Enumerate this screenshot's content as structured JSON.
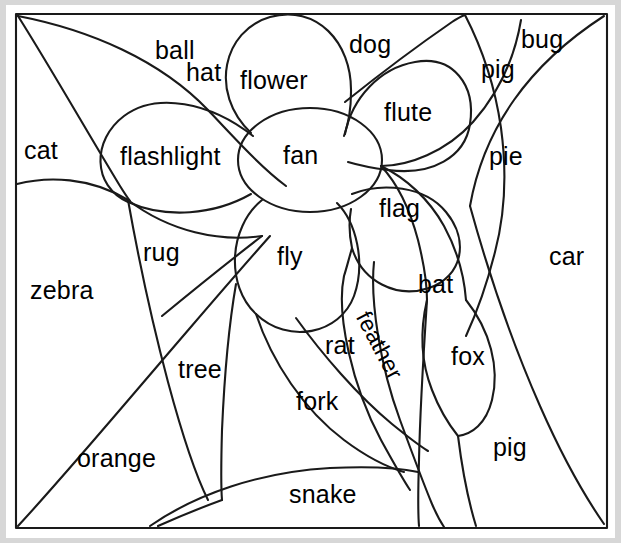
{
  "worksheet": {
    "title": "Flower picture word puzzle",
    "description": "A line drawing of a flower divided into labeled regions; each region of the picture is marked with a word.",
    "paper_color": "#ffffff",
    "page_color": "#d7d7d7",
    "ink_color": "#1a1a1a",
    "frame": {
      "name": "picture-frame-border",
      "stroke_color": "#1a1a1a"
    }
  },
  "regions": [
    {
      "id": "hat",
      "label": "hat",
      "x": 186,
      "y": 58,
      "size": 25,
      "rotate": 0
    },
    {
      "id": "ball",
      "label": "ball",
      "x": 155,
      "y": 36,
      "size": 25,
      "rotate": 0
    },
    {
      "id": "flower",
      "label": "flower",
      "x": 240,
      "y": 66,
      "size": 25,
      "rotate": 0
    },
    {
      "id": "dog",
      "label": "dog",
      "x": 349,
      "y": 30,
      "size": 25,
      "rotate": 0
    },
    {
      "id": "bug",
      "label": "bug",
      "x": 521,
      "y": 25,
      "size": 25,
      "rotate": 0
    },
    {
      "id": "pig-top",
      "label": "pig",
      "x": 481,
      "y": 55,
      "size": 25,
      "rotate": 0
    },
    {
      "id": "flute",
      "label": "flute",
      "x": 384,
      "y": 98,
      "size": 25,
      "rotate": 0
    },
    {
      "id": "cat",
      "label": "cat",
      "x": 24,
      "y": 136,
      "size": 25,
      "rotate": 0
    },
    {
      "id": "flashlight",
      "label": "flashlight",
      "x": 120,
      "y": 142,
      "size": 25,
      "rotate": 0
    },
    {
      "id": "fan",
      "label": "fan",
      "x": 283,
      "y": 141,
      "size": 25,
      "rotate": 0
    },
    {
      "id": "pie",
      "label": "pie",
      "x": 489,
      "y": 142,
      "size": 25,
      "rotate": 0
    },
    {
      "id": "flag",
      "label": "flag",
      "x": 379,
      "y": 194,
      "size": 25,
      "rotate": 0
    },
    {
      "id": "rug",
      "label": "rug",
      "x": 143,
      "y": 238,
      "size": 25,
      "rotate": 0
    },
    {
      "id": "fly",
      "label": "fly",
      "x": 277,
      "y": 242,
      "size": 25,
      "rotate": 0
    },
    {
      "id": "car",
      "label": "car",
      "x": 549,
      "y": 242,
      "size": 25,
      "rotate": 0
    },
    {
      "id": "bat",
      "label": "bat",
      "x": 418,
      "y": 270,
      "size": 25,
      "rotate": 0
    },
    {
      "id": "zebra",
      "label": "zebra",
      "x": 30,
      "y": 276,
      "size": 25,
      "rotate": 0
    },
    {
      "id": "rat",
      "label": "rat",
      "x": 325,
      "y": 331,
      "size": 25,
      "rotate": 0
    },
    {
      "id": "feather",
      "label": "feather",
      "x": 374,
      "y": 307,
      "size": 23,
      "rotate": 62
    },
    {
      "id": "fox",
      "label": "fox",
      "x": 451,
      "y": 342,
      "size": 25,
      "rotate": 0
    },
    {
      "id": "tree",
      "label": "tree",
      "x": 178,
      "y": 355,
      "size": 25,
      "rotate": 0
    },
    {
      "id": "fork",
      "label": "fork",
      "x": 296,
      "y": 387,
      "size": 25,
      "rotate": 0
    },
    {
      "id": "pig-bottom",
      "label": "pig",
      "x": 493,
      "y": 433,
      "size": 25,
      "rotate": 0
    },
    {
      "id": "orange",
      "label": "orange",
      "x": 77,
      "y": 444,
      "size": 25,
      "rotate": 0
    },
    {
      "id": "snake",
      "label": "snake",
      "x": 289,
      "y": 480,
      "size": 25,
      "rotate": 0
    }
  ]
}
